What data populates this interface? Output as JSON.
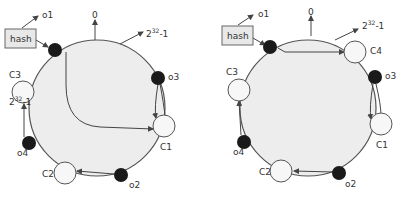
{
  "colors": {
    "ring_fill": "#ededed",
    "ring_stroke": "#555555",
    "object_node": "#1a1a1a",
    "cache_node": "#f7f7f7",
    "hash_box": "#e8e8e8"
  },
  "diagrams": [
    {
      "hash_label": "hash",
      "o1": "o1",
      "zero": "0",
      "max_base": "2",
      "max_exp": "32",
      "max_tail": "-1",
      "o3": "o3",
      "c1": "C1",
      "o2": "o2",
      "c2": "C2",
      "o4": "o4",
      "c3": "C3",
      "overlap_base": "2",
      "overlap_exp": "32",
      "overlap_tail": "-1"
    },
    {
      "hash_label": "hash",
      "o1": "o1",
      "zero": "0",
      "max_base": "2",
      "max_exp": "32",
      "max_tail": "-1",
      "c4": "C4",
      "o3": "o3",
      "c1": "C1",
      "o2": "o2",
      "c2": "C2",
      "o4": "o4",
      "c3": "C3"
    }
  ]
}
